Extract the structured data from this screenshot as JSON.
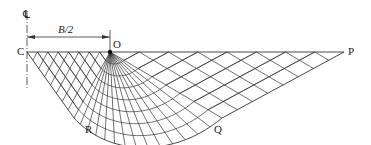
{
  "diagram": {
    "labels": {
      "centerline": "℄",
      "dimension": "B/2",
      "C": "C",
      "O": "O",
      "P": "P",
      "R": "R",
      "Q": "Q"
    },
    "points": {
      "C": [
        27,
        52
      ],
      "O": [
        110,
        52
      ],
      "P": [
        344,
        52
      ],
      "R": [
        74,
        118
      ],
      "Q": [
        222,
        118
      ]
    },
    "colors": {
      "line": "#333333",
      "background": "#ffffff"
    },
    "mesh": {
      "fan_rays": 14,
      "fan_arcs": 8,
      "left_zone_lines": 8,
      "right_zone_lines": 8
    }
  }
}
